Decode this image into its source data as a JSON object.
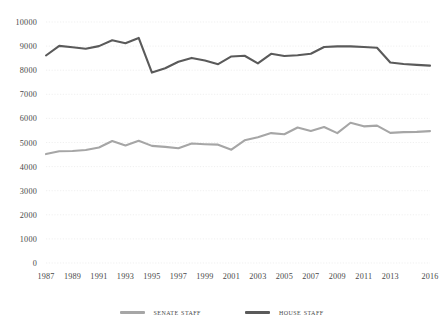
{
  "chart_data": {
    "type": "line",
    "title": "",
    "subtitle": "",
    "xlabel": "",
    "ylabel": "",
    "ylim": [
      0,
      10000
    ],
    "ytick_labels": [
      "10000",
      "9000",
      "8000",
      "7000",
      "6000",
      "5000",
      "4000",
      "3000",
      "2000",
      "1000",
      "0"
    ],
    "ytick_values": [
      10000,
      9000,
      8000,
      7000,
      6000,
      5000,
      4000,
      3000,
      2000,
      1000,
      0
    ],
    "grid": true,
    "grid_axis": "y",
    "legend_position": "bottom",
    "x": [
      1987,
      1988,
      1989,
      1990,
      1991,
      1992,
      1993,
      1994,
      1995,
      1996,
      1997,
      1998,
      1999,
      2000,
      2001,
      2002,
      2003,
      2004,
      2005,
      2006,
      2007,
      2008,
      2009,
      2010,
      2011,
      2012,
      2013,
      2014,
      2015,
      2016
    ],
    "xtick_labels": [
      "1987",
      "1989",
      "1991",
      "1993",
      "1995",
      "1997",
      "1999",
      "2001",
      "2003",
      "2005",
      "2007",
      "2009",
      "2011",
      "2013",
      "2016"
    ],
    "xtick_values": [
      1987,
      1989,
      1991,
      1993,
      1995,
      1997,
      1999,
      2001,
      2003,
      2005,
      2007,
      2009,
      2011,
      2013,
      2016
    ],
    "series": [
      {
        "name": "Senate Staff",
        "color": "#a6a6a6",
        "values": [
          4520,
          4640,
          4650,
          4690,
          4790,
          5060,
          4880,
          5070,
          4860,
          4820,
          4760,
          4960,
          4930,
          4910,
          4700,
          5090,
          5220,
          5390,
          5340,
          5620,
          5480,
          5640,
          5390,
          5820,
          5670,
          5700,
          5400,
          5430,
          5440,
          5470
        ]
      },
      {
        "name": "House Staff",
        "color": "#5a5a5a",
        "values": [
          8610,
          9010,
          8950,
          8890,
          9000,
          9240,
          9120,
          9340,
          7900,
          8080,
          8350,
          8510,
          8400,
          8250,
          8570,
          8600,
          8280,
          8680,
          8590,
          8620,
          8680,
          8960,
          8990,
          8990,
          8960,
          8930,
          8320,
          8260,
          8220,
          8190
        ]
      }
    ]
  },
  "legend": {
    "items": [
      {
        "label": "Senate Staff",
        "color": "#a6a6a6"
      },
      {
        "label": "House Staff",
        "color": "#5a5a5a"
      }
    ]
  }
}
